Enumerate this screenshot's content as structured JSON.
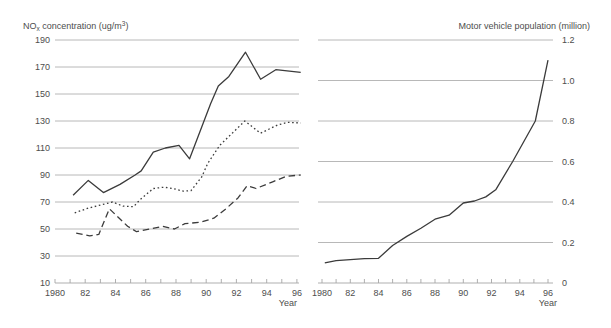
{
  "figure": {
    "background": "#ffffff",
    "text_color": "#4d4d4d",
    "grid_color": "#a6a6a6",
    "line_color": "#3b3b3b"
  },
  "chart_data": [
    {
      "id": "nox-concentration",
      "type": "line",
      "title": "NOx concentration (ug/m3)",
      "title_parts": {
        "pre": "NO",
        "sub": "x",
        "mid": " concentration (ug/m",
        "sup": "3",
        "post": ")"
      },
      "xlabel": "Year",
      "x_range": [
        1980,
        1996
      ],
      "x_tick_labels": [
        "1980",
        "82",
        "84",
        "86",
        "88",
        "90",
        "92",
        "94",
        "96"
      ],
      "y_range": [
        10,
        190
      ],
      "y_ticks": [
        10,
        30,
        50,
        70,
        90,
        110,
        130,
        150,
        170,
        190
      ],
      "y_tick_labels": [
        "10",
        "30",
        "50",
        "70",
        "90",
        "110",
        "130",
        "150",
        "170",
        "190"
      ],
      "grid": true,
      "legend_position": "inline-annotations",
      "series": [
        {
          "name": "Winter, spring",
          "style": "solid",
          "points": [
            [
              1981.2,
              75
            ],
            [
              1982.2,
              86
            ],
            [
              1983.2,
              77
            ],
            [
              1984.3,
              83
            ],
            [
              1985.3,
              90
            ],
            [
              1985.7,
              93
            ],
            [
              1986.5,
              107
            ],
            [
              1987.3,
              110
            ],
            [
              1988.2,
              112
            ],
            [
              1988.9,
              102
            ],
            [
              1990.3,
              143
            ],
            [
              1990.8,
              156
            ],
            [
              1991.5,
              163
            ],
            [
              1992.6,
              181
            ],
            [
              1993.6,
              161
            ],
            [
              1994.6,
              168
            ],
            [
              1996.25,
              166
            ]
          ]
        },
        {
          "name": "Annual average",
          "style": "dotted",
          "points": [
            [
              1981.3,
              62
            ],
            [
              1982.2,
              65.5
            ],
            [
              1983.1,
              68
            ],
            [
              1983.8,
              70
            ],
            [
              1984.5,
              67
            ],
            [
              1985.2,
              66.5
            ],
            [
              1985.6,
              71.5
            ],
            [
              1986.5,
              80
            ],
            [
              1987.2,
              81
            ],
            [
              1987.8,
              80
            ],
            [
              1988.5,
              78
            ],
            [
              1989,
              78.5
            ],
            [
              1989.7,
              88.5
            ],
            [
              1990.1,
              98.5
            ],
            [
              1990.9,
              112
            ],
            [
              1992.55,
              130
            ],
            [
              1993.6,
              121
            ],
            [
              1994.7,
              127
            ],
            [
              1995.4,
              129
            ],
            [
              1996.25,
              128.5
            ]
          ]
        },
        {
          "name": "Summer, fall",
          "style": "dashed",
          "points": [
            [
              1981.4,
              47
            ],
            [
              1982.3,
              45
            ],
            [
              1982.9,
              46
            ],
            [
              1983.6,
              65
            ],
            [
              1984.8,
              52
            ],
            [
              1985.4,
              48
            ],
            [
              1986.3,
              50
            ],
            [
              1987.1,
              52
            ],
            [
              1987.9,
              50
            ],
            [
              1988.6,
              54
            ],
            [
              1989.6,
              55
            ],
            [
              1990.5,
              58
            ],
            [
              1991.3,
              65
            ],
            [
              1992.1,
              73
            ],
            [
              1992.7,
              82
            ],
            [
              1993.3,
              80
            ],
            [
              1994.4,
              85
            ],
            [
              1995.3,
              89
            ],
            [
              1996.25,
              90
            ]
          ]
        }
      ],
      "annotations": [
        {
          "text": "Winter, spring",
          "text_at": [
            11.38,
            138
          ],
          "arrow_from": [
            11.18,
            141
          ],
          "arrow_to": [
            10.55,
            147.5
          ]
        },
        {
          "text": "Annual average",
          "text_at": [
            11.5,
            96
          ],
          "arrow_from": [
            11.31,
            99
          ],
          "arrow_to": [
            10.95,
            105.5
          ]
        },
        {
          "text": "Summer, fall",
          "text_at": [
            12.25,
            56
          ],
          "arrow_from": [
            12.04,
            59
          ],
          "arrow_to": [
            11.32,
            64.5
          ]
        }
      ]
    },
    {
      "id": "motor-vehicle-population",
      "type": "line",
      "title": "Motor vehicle population (million)",
      "xlabel": "Year",
      "x_range": [
        1980,
        1996
      ],
      "x_tick_labels": [
        "1980",
        "82",
        "84",
        "86",
        "88",
        "90",
        "92",
        "94",
        "96"
      ],
      "y_range": [
        0,
        1.2
      ],
      "y_ticks": [
        0,
        0.2,
        0.4,
        0.6,
        0.8,
        1.0,
        1.2
      ],
      "y_tick_labels": [
        "0",
        "0.2",
        "0.4",
        "0.6",
        "0.8",
        "1.0",
        "1.2"
      ],
      "grid": true,
      "legend_position": "none",
      "series": [
        {
          "name": "Motor vehicle population",
          "style": "solid",
          "points": [
            [
              1980.2,
              0.1
            ],
            [
              1981,
              0.11
            ],
            [
              1982,
              0.115
            ],
            [
              1983,
              0.12
            ],
            [
              1984,
              0.122
            ],
            [
              1985,
              0.185
            ],
            [
              1986,
              0.23
            ],
            [
              1987,
              0.27
            ],
            [
              1988,
              0.315
            ],
            [
              1989,
              0.335
            ],
            [
              1990,
              0.395
            ],
            [
              1990.8,
              0.405
            ],
            [
              1991.6,
              0.425
            ],
            [
              1992.3,
              0.46
            ],
            [
              1993.5,
              0.6
            ],
            [
              1995.1,
              0.8
            ],
            [
              1996,
              1.1
            ]
          ]
        }
      ],
      "annotations": []
    }
  ]
}
